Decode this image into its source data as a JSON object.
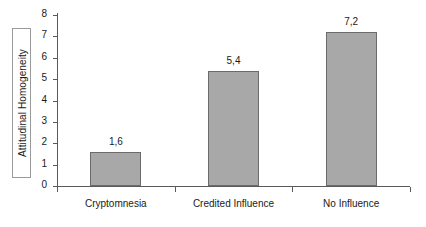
{
  "chart_data": {
    "type": "bar",
    "title": "",
    "xlabel": "",
    "ylabel": "Attitudinal Homogeneity",
    "categories": [
      "Cryptomnesia",
      "Credited Influence",
      "No Influence"
    ],
    "values": [
      1.6,
      5.4,
      7.2
    ],
    "value_labels": [
      "1,6",
      "5,4",
      "7,2"
    ],
    "ylim": [
      0,
      8
    ],
    "y_ticks": [
      0,
      1,
      2,
      3,
      4,
      5,
      6,
      7,
      8
    ],
    "y_tick_labels": [
      "0",
      "1",
      "2",
      "3",
      "4",
      "5",
      "6",
      "7",
      "8"
    ],
    "grid": false,
    "legend": false,
    "decimal_separator": ",",
    "colors": {
      "bar_fill": "#a8a8a8",
      "bar_border": "#6b6b6b",
      "axis": "#5a5a5a",
      "text": "#1a1a1a",
      "background": "#ffffff",
      "label_box_border": "#9a9a9a"
    }
  }
}
